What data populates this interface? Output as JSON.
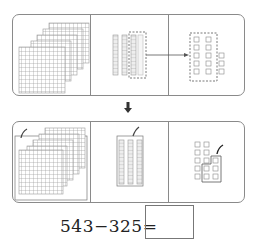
{
  "diagram": {
    "top_panel": {
      "hundreds": 5,
      "tens": 4,
      "ones": 3,
      "regroup_note": "one ten block (dashed) converted to ten ones (dashed group)"
    },
    "bottom_panel": {
      "hundreds_remaining_shown": 5,
      "hundreds_crossed": 3,
      "tens_shown": 3,
      "tens_crossed": 2,
      "ones_shown": 13,
      "ones_crossed": 5
    },
    "colors": {
      "line": "#8a8a8a",
      "block": "#9a9a9a",
      "text": "#222222"
    }
  },
  "equation": {
    "text": "543−325=",
    "answer": ""
  }
}
